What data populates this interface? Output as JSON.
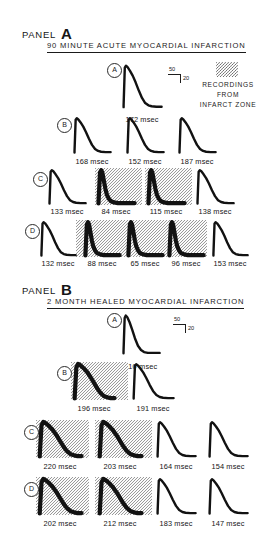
{
  "figure": {
    "legend": {
      "swatch_name": "infarct-zone-hatch-swatch",
      "lines": [
        "RECORDINGS",
        "FROM",
        "INFARCT ZONE"
      ]
    },
    "scale_bars": [
      {
        "id": "panel-a-scale-bar",
        "horizontal_value": "50",
        "vertical_value": "20"
      },
      {
        "id": "panel-b-scale-bar",
        "horizontal_value": "50",
        "vertical_value": "20"
      }
    ],
    "panels": [
      {
        "id": "panel-a",
        "panel_word": "PANEL",
        "panel_letter": "A",
        "title": "90 MINUTE ACUTE MYOCARDIAL INFARCTION",
        "rows": [
          {
            "tag": "A",
            "traces": [
              {
                "duration": "172 msec",
                "infarct": false,
                "shape": "long-plateau"
              }
            ]
          },
          {
            "tag": "B",
            "traces": [
              {
                "duration": "168 msec",
                "infarct": false,
                "shape": "long-plateau"
              },
              {
                "duration": "152 msec",
                "infarct": false,
                "shape": "long-plateau"
              },
              {
                "duration": "187 msec",
                "infarct": false,
                "shape": "long-plateau"
              }
            ]
          },
          {
            "tag": "C",
            "traces": [
              {
                "duration": "133 msec",
                "infarct": false,
                "shape": "long-plateau"
              },
              {
                "duration": "84 msec",
                "infarct": true,
                "shape": "short-spike"
              },
              {
                "duration": "115 msec",
                "infarct": true,
                "shape": "short-spike"
              },
              {
                "duration": "138 msec",
                "infarct": false,
                "shape": "long-plateau"
              }
            ]
          },
          {
            "tag": "D",
            "traces": [
              {
                "duration": "132 msec",
                "infarct": false,
                "shape": "long-plateau"
              },
              {
                "duration": "88 msec",
                "infarct": true,
                "shape": "short-spike"
              },
              {
                "duration": "65 msec",
                "infarct": true,
                "shape": "short-spike"
              },
              {
                "duration": "96 msec",
                "infarct": true,
                "shape": "short-spike"
              },
              {
                "duration": "153 msec",
                "infarct": false,
                "shape": "long-plateau"
              }
            ]
          }
        ]
      },
      {
        "id": "panel-b",
        "panel_word": "PANEL",
        "panel_letter": "B",
        "title": "2 MONTH HEALED MYOCARDIAL INFARCTION",
        "rows": [
          {
            "tag": "A",
            "traces": [
              {
                "duration": "110 msec",
                "infarct": false,
                "shape": "short-plateau"
              }
            ]
          },
          {
            "tag": "B",
            "traces": [
              {
                "duration": "196 msec",
                "infarct": true,
                "shape": "wide-plateau"
              },
              {
                "duration": "191 msec",
                "infarct": false,
                "shape": "long-plateau"
              }
            ]
          },
          {
            "tag": "C",
            "traces": [
              {
                "duration": "220 msec",
                "infarct": true,
                "shape": "wide-plateau"
              },
              {
                "duration": "203 msec",
                "infarct": true,
                "shape": "wide-plateau"
              },
              {
                "duration": "164 msec",
                "infarct": false,
                "shape": "long-plateau"
              },
              {
                "duration": "154 msec",
                "infarct": false,
                "shape": "long-plateau"
              }
            ]
          },
          {
            "tag": "D",
            "traces": [
              {
                "duration": "202 msec",
                "infarct": true,
                "shape": "wide-plateau"
              },
              {
                "duration": "212 msec",
                "infarct": true,
                "shape": "wide-plateau"
              },
              {
                "duration": "183 msec",
                "infarct": false,
                "shape": "long-plateau"
              },
              {
                "duration": "147 msec",
                "infarct": false,
                "shape": "long-plateau"
              }
            ]
          }
        ]
      }
    ]
  },
  "chart_data": {
    "type": "line",
    "ylabel": "Membrane potential (mV)",
    "xlabel": "Time (msec)",
    "units": {
      "vertical": "20 mV",
      "horizontal": "50 msec"
    },
    "series": [
      {
        "name": "Panel A - row A - trace 1",
        "panel": "A",
        "row": "A",
        "apd_msec": 172,
        "infarct_zone": false
      },
      {
        "name": "Panel A - row B - trace 1",
        "panel": "A",
        "row": "B",
        "apd_msec": 168,
        "infarct_zone": false
      },
      {
        "name": "Panel A - row B - trace 2",
        "panel": "A",
        "row": "B",
        "apd_msec": 152,
        "infarct_zone": false
      },
      {
        "name": "Panel A - row B - trace 3",
        "panel": "A",
        "row": "B",
        "apd_msec": 187,
        "infarct_zone": false
      },
      {
        "name": "Panel A - row C - trace 1",
        "panel": "A",
        "row": "C",
        "apd_msec": 133,
        "infarct_zone": false
      },
      {
        "name": "Panel A - row C - trace 2",
        "panel": "A",
        "row": "C",
        "apd_msec": 84,
        "infarct_zone": true
      },
      {
        "name": "Panel A - row C - trace 3",
        "panel": "A",
        "row": "C",
        "apd_msec": 115,
        "infarct_zone": true
      },
      {
        "name": "Panel A - row C - trace 4",
        "panel": "A",
        "row": "C",
        "apd_msec": 138,
        "infarct_zone": false
      },
      {
        "name": "Panel A - row D - trace 1",
        "panel": "A",
        "row": "D",
        "apd_msec": 132,
        "infarct_zone": false
      },
      {
        "name": "Panel A - row D - trace 2",
        "panel": "A",
        "row": "D",
        "apd_msec": 88,
        "infarct_zone": true
      },
      {
        "name": "Panel A - row D - trace 3",
        "panel": "A",
        "row": "D",
        "apd_msec": 65,
        "infarct_zone": true
      },
      {
        "name": "Panel A - row D - trace 4",
        "panel": "A",
        "row": "D",
        "apd_msec": 96,
        "infarct_zone": true
      },
      {
        "name": "Panel A - row D - trace 5",
        "panel": "A",
        "row": "D",
        "apd_msec": 153,
        "infarct_zone": false
      },
      {
        "name": "Panel B - row A - trace 1",
        "panel": "B",
        "row": "A",
        "apd_msec": 110,
        "infarct_zone": false
      },
      {
        "name": "Panel B - row B - trace 1",
        "panel": "B",
        "row": "B",
        "apd_msec": 196,
        "infarct_zone": true
      },
      {
        "name": "Panel B - row B - trace 2",
        "panel": "B",
        "row": "B",
        "apd_msec": 191,
        "infarct_zone": false
      },
      {
        "name": "Panel B - row C - trace 1",
        "panel": "B",
        "row": "C",
        "apd_msec": 220,
        "infarct_zone": true
      },
      {
        "name": "Panel B - row C - trace 2",
        "panel": "B",
        "row": "C",
        "apd_msec": 203,
        "infarct_zone": true
      },
      {
        "name": "Panel B - row C - trace 3",
        "panel": "B",
        "row": "C",
        "apd_msec": 164,
        "infarct_zone": false
      },
      {
        "name": "Panel B - row C - trace 4",
        "panel": "B",
        "row": "C",
        "apd_msec": 154,
        "infarct_zone": false
      },
      {
        "name": "Panel B - row D - trace 1",
        "panel": "B",
        "row": "D",
        "apd_msec": 202,
        "infarct_zone": true
      },
      {
        "name": "Panel B - row D - trace 2",
        "panel": "B",
        "row": "D",
        "apd_msec": 212,
        "infarct_zone": true
      },
      {
        "name": "Panel B - row D - trace 3",
        "panel": "B",
        "row": "D",
        "apd_msec": 183,
        "infarct_zone": false
      },
      {
        "name": "Panel B - row D - trace 4",
        "panel": "B",
        "row": "D",
        "apd_msec": 147,
        "infarct_zone": false
      }
    ],
    "legend": [
      "RECORDINGS FROM INFARCT ZONE (hatched background)"
    ],
    "grid": false
  }
}
